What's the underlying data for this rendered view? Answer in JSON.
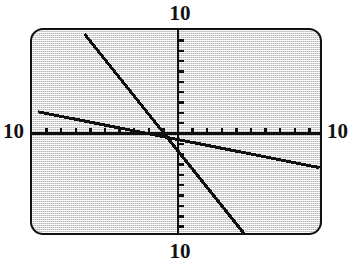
{
  "window_labels": {
    "top": "10",
    "bottom": "10",
    "left": "10",
    "right": "10"
  },
  "colors": {
    "screen_background": "#d8d8d8",
    "screen_border": "#111111",
    "ink": "#101010",
    "label_text": "#121212"
  },
  "chart_data": {
    "type": "line",
    "title": "",
    "xlabel": "",
    "ylabel": "",
    "xlim": [
      -10,
      10
    ],
    "ylim": [
      -10,
      10
    ],
    "grid": false,
    "legend": "none",
    "axes": {
      "x_axis": {
        "y": 0,
        "ticks_each_side": 10,
        "tick_direction": "up"
      },
      "y_axis": {
        "x": 0,
        "ticks_each_side": 10,
        "tick_direction": "right"
      }
    },
    "window_label_value": 10,
    "series": [
      {
        "name": "steep-descending-line",
        "slope": -2.0,
        "intercept": -0.6,
        "x": [
          -6.4,
          4.6
        ],
        "y": [
          12.2,
          -9.8
        ],
        "visible_segment": {
          "x": [
            -6.4,
            4.6
          ],
          "y": [
            9.6,
            -9.8
          ]
        }
      },
      {
        "name": "shallow-descending-line",
        "slope": -0.28,
        "intercept": -0.6,
        "x": [
          -9.6,
          9.7
        ],
        "y": [
          2.1,
          -3.3
        ],
        "visible_segment": {
          "x": [
            -9.6,
            9.7
          ],
          "y": [
            2.1,
            -3.3
          ]
        }
      }
    ]
  }
}
